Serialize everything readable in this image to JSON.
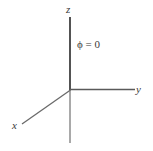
{
  "figure": {
    "type": "coordinate-axes-diagram",
    "background_color": "#ffffff",
    "line_color_primary": "#4a4a4a",
    "line_color_secondary": "#8c8c8c",
    "text_color": "#3a3a3a",
    "width": 153,
    "height": 151
  },
  "axes": {
    "origin": {
      "x": 70,
      "y": 90
    },
    "z_axis": {
      "label": "z",
      "from": {
        "x": 70,
        "y": 17
      },
      "to": {
        "x": 70,
        "y": 90
      },
      "color": "#4a4a4a"
    },
    "z_axis_negative": {
      "label": "",
      "from": {
        "x": 70,
        "y": 90
      },
      "to": {
        "x": 70,
        "y": 143
      },
      "color": "#8c8c8c"
    },
    "y_axis": {
      "label": "y",
      "from": {
        "x": 70,
        "y": 89
      },
      "to": {
        "x": 135,
        "y": 89
      },
      "color": "#5a5a5a"
    },
    "x_axis": {
      "label": "x",
      "from": {
        "x": 70,
        "y": 90
      },
      "to": {
        "x": 22,
        "y": 124
      },
      "color": "#6a6a6a"
    }
  },
  "labels": {
    "z": "z",
    "y": "y",
    "x": "x"
  },
  "annotations": {
    "phi_symbol": "ϕ",
    "phi_equation_rest": " = 0",
    "phi_full": "ϕ = 0"
  }
}
